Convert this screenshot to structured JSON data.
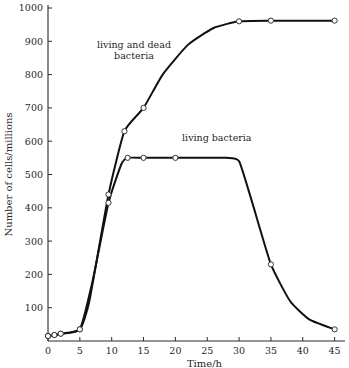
{
  "chart_data": {
    "type": "line",
    "title": "",
    "xlabel": "Time/h",
    "ylabel": "Number of cells/millions",
    "xlim": [
      0,
      46
    ],
    "ylim": [
      0,
      1000
    ],
    "grid": false,
    "legend_position": "inline-annotations",
    "xticks": [
      0,
      5,
      10,
      15,
      20,
      25,
      30,
      35,
      40,
      45
    ],
    "xtick_labels": [
      "0",
      "5",
      "10",
      "15",
      "20",
      "25",
      "30",
      "35",
      "40",
      "45"
    ],
    "yticks": [
      100,
      200,
      300,
      400,
      500,
      600,
      700,
      800,
      900,
      1000
    ],
    "ytick_labels": [
      "100",
      "200",
      "300",
      "400",
      "500",
      "600",
      "700",
      "800",
      "900",
      "1000"
    ],
    "series": [
      {
        "name": "living and dead bacteria",
        "annotation": "living and dead bacteria",
        "annotation_line1": "living and dead",
        "annotation_line2": "bacteria",
        "annotation_x": 13.5,
        "annotation_y": 880,
        "marker": "open-circle",
        "x": [
          0,
          1,
          2,
          5,
          6.5,
          9.5,
          12,
          15,
          18,
          22,
          26,
          30,
          35,
          45
        ],
        "y": [
          15,
          18,
          22,
          35,
          120,
          440,
          630,
          700,
          800,
          890,
          940,
          960,
          962,
          962
        ],
        "data_points": [
          {
            "x": 0,
            "y": 15,
            "marked": true
          },
          {
            "x": 1,
            "y": 18,
            "marked": true
          },
          {
            "x": 2,
            "y": 22,
            "marked": true
          },
          {
            "x": 5,
            "y": 35,
            "marked": true
          },
          {
            "x": 9.5,
            "y": 440,
            "marked": true
          },
          {
            "x": 12,
            "y": 630,
            "marked": true
          },
          {
            "x": 15,
            "y": 700,
            "marked": true
          },
          {
            "x": 30,
            "y": 960,
            "marked": true
          },
          {
            "x": 35,
            "y": 962,
            "marked": true
          },
          {
            "x": 45,
            "y": 962,
            "marked": true
          }
        ]
      },
      {
        "name": "living bacteria",
        "annotation": "living bacteria",
        "annotation_x": 26.5,
        "annotation_y": 600,
        "marker": "open-circle",
        "x": [
          0,
          1,
          2,
          5,
          7,
          9.5,
          11.5,
          12.5,
          15,
          20,
          28,
          30,
          32,
          35,
          38,
          41,
          45
        ],
        "y": [
          15,
          18,
          22,
          35,
          180,
          415,
          530,
          550,
          550,
          550,
          550,
          540,
          420,
          230,
          120,
          65,
          35
        ],
        "data_points": [
          {
            "x": 0,
            "y": 15,
            "marked": true
          },
          {
            "x": 1,
            "y": 18,
            "marked": true
          },
          {
            "x": 2,
            "y": 22,
            "marked": true
          },
          {
            "x": 5,
            "y": 35,
            "marked": true
          },
          {
            "x": 9.5,
            "y": 415,
            "marked": true
          },
          {
            "x": 12.5,
            "y": 550,
            "marked": true
          },
          {
            "x": 15,
            "y": 550,
            "marked": true
          },
          {
            "x": 20,
            "y": 550,
            "marked": true
          },
          {
            "x": 35,
            "y": 230,
            "marked": true
          },
          {
            "x": 45,
            "y": 35,
            "marked": true
          }
        ]
      }
    ]
  }
}
